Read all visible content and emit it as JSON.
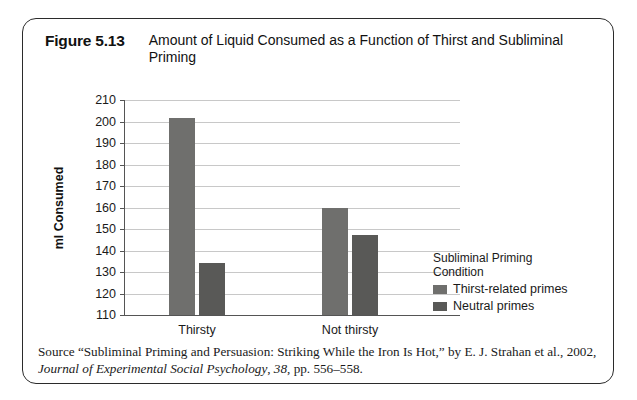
{
  "figure": {
    "number": "Figure 5.13",
    "title": "Amount of Liquid Consumed as a Function of Thirst and Subliminal Priming"
  },
  "chart_data": {
    "type": "bar",
    "title": "Amount of Liquid Consumed as a Function of Thirst and Subliminal Priming",
    "xlabel": "",
    "ylabel": "ml Consumed",
    "ylim": [
      110,
      210
    ],
    "ytick_step": 10,
    "yticks": [
      "210",
      "200",
      "190",
      "180",
      "170",
      "160",
      "150",
      "140",
      "130",
      "120",
      "110"
    ],
    "grid": true,
    "legend_position": "right",
    "categories": [
      "Thirsty",
      "Not thirsty"
    ],
    "series": [
      {
        "name": "Thirst-related primes",
        "color": "#6f6f6d",
        "values": [
          201.5,
          160
        ]
      },
      {
        "name": "Neutral primes",
        "color": "#595957",
        "values": [
          134,
          147
        ]
      }
    ]
  },
  "legend": {
    "title_line1": "Subliminal Priming",
    "title_line2": "Condition"
  },
  "source": {
    "line1_part1": "Source “Subliminal Priming and Persuasion: Striking While the Iron Is Hot,” by E. J. Strahan et al., 2002,",
    "journal": "Journal of Experimental Social Psychology",
    "line2_rest": ", ",
    "volume": "38",
    "pages": ", pp. 556–558."
  }
}
